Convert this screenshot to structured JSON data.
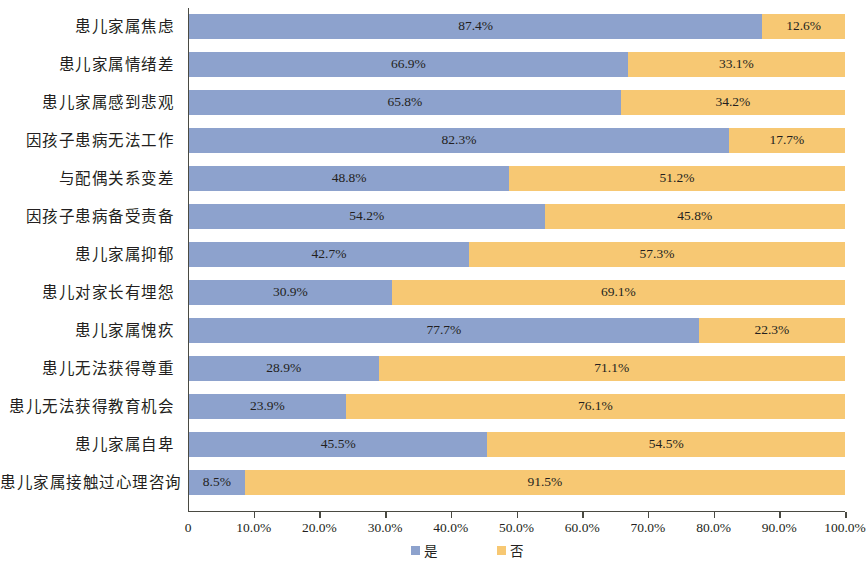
{
  "chart_data": {
    "type": "bar",
    "orientation": "horizontal",
    "stacked": true,
    "normalized_percent": true,
    "title": "",
    "subtitle": "",
    "xlabel": "",
    "ylabel": "",
    "xlim": [
      0,
      100
    ],
    "grid": false,
    "legend_position": "bottom",
    "categories": [
      "患儿家属焦虑",
      "患儿家属情绪差",
      "患儿家属感到悲观",
      "因孩子患病无法工作",
      "与配偶关系变差",
      "因孩子患病备受责备",
      "患儿家属抑郁",
      "患儿对家长有埋怨",
      "患儿家属愧疚",
      "患儿无法获得尊重",
      "患儿无法获得教育机会",
      "患儿家属自卑",
      "患儿家属接触过心理咨询"
    ],
    "series": [
      {
        "name": "是",
        "color": "#8da2cd",
        "values": [
          87.4,
          66.9,
          65.8,
          82.3,
          48.8,
          54.2,
          42.7,
          30.9,
          77.7,
          28.9,
          23.9,
          45.5,
          8.5
        ],
        "labels": [
          "87.4%",
          "66.9%",
          "65.8%",
          "82.3%",
          "48.8%",
          "54.2%",
          "42.7%",
          "30.9%",
          "77.7%",
          "28.9%",
          "23.9%",
          "45.5%",
          "8.5%"
        ]
      },
      {
        "name": "否",
        "color": "#f7c873",
        "values": [
          12.6,
          33.1,
          34.2,
          17.7,
          51.2,
          45.8,
          57.3,
          69.1,
          22.3,
          71.1,
          76.1,
          54.5,
          91.5
        ],
        "labels": [
          "12.6%",
          "33.1%",
          "34.2%",
          "17.7%",
          "51.2%",
          "45.8%",
          "57.3%",
          "69.1%",
          "22.3%",
          "71.1%",
          "76.1%",
          "54.5%",
          "91.5%"
        ]
      }
    ],
    "xticks": [
      0,
      10,
      20,
      30,
      40,
      50,
      60,
      70,
      80,
      90,
      100
    ],
    "xticklabels": [
      "0",
      "10.0%",
      "20.0%",
      "30.0%",
      "40.0%",
      "50.0%",
      "60.0%",
      "70.0%",
      "80.0%",
      "90.0%",
      "100.0%"
    ],
    "legend": [
      {
        "label": "是",
        "color": "#8da2cd"
      },
      {
        "label": "否",
        "color": "#f7c873"
      }
    ]
  },
  "colors": {
    "series_yes": "#8da2cd",
    "series_no": "#f7c873",
    "axis": "#4a4a42",
    "text": "#231f20",
    "background": "#ffffff"
  }
}
